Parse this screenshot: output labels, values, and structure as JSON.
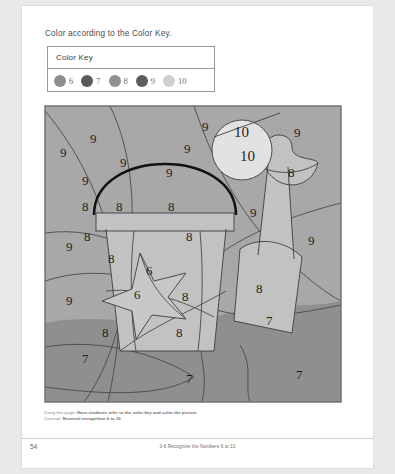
{
  "worksheet": {
    "instruction": "Color according to the Color Key.",
    "color_key": {
      "title": "Color Key",
      "entries": [
        {
          "number": "6",
          "color": "#8e8e8e"
        },
        {
          "number": "7",
          "color": "#5a5a5a"
        },
        {
          "number": "8",
          "color": "#909090"
        },
        {
          "number": "9",
          "color": "#5e5e5e"
        },
        {
          "number": "10",
          "color": "#cfcfcf"
        }
      ]
    },
    "footnote": {
      "using_label": "Using this page:",
      "using_text": "Have students refer to the color key and color the picture.",
      "concept_label": "Concept:",
      "concept_text": "Numeral recognition 6 to 10"
    },
    "page_number": "54",
    "footer_title": "3-6 Recognize the Numbers 6 to 10"
  },
  "picture": {
    "title": "beach scene color by number",
    "fills": {
      "sky": "#a8a8a8",
      "sand": "#8f8f8f",
      "bucket": "#c2c2c2",
      "star": "#c8c8c8",
      "shovel": "#c2c2c2",
      "sun": "#e2e2e2",
      "border": "#6d6d6d"
    },
    "labels": [
      {
        "value": "9",
        "x": 46,
        "y": 38
      },
      {
        "value": "9",
        "x": 16,
        "y": 52
      },
      {
        "value": "9",
        "x": 158,
        "y": 26
      },
      {
        "value": "9",
        "x": 250,
        "y": 32
      },
      {
        "value": "9",
        "x": 140,
        "y": 48
      },
      {
        "value": "9",
        "x": 76,
        "y": 62
      },
      {
        "value": "9",
        "x": 122,
        "y": 72
      },
      {
        "value": "9",
        "x": 38,
        "y": 80
      },
      {
        "value": "9",
        "x": 206,
        "y": 112
      },
      {
        "value": "9",
        "x": 264,
        "y": 140
      },
      {
        "value": "9",
        "x": 22,
        "y": 146
      },
      {
        "value": "9",
        "x": 22,
        "y": 200
      },
      {
        "value": "10",
        "x": 190,
        "y": 32,
        "big": true
      },
      {
        "value": "10",
        "x": 196,
        "y": 56,
        "big": true
      },
      {
        "value": "8",
        "x": 244,
        "y": 72
      },
      {
        "value": "8",
        "x": 38,
        "y": 106
      },
      {
        "value": "8",
        "x": 72,
        "y": 106
      },
      {
        "value": "8",
        "x": 124,
        "y": 106
      },
      {
        "value": "8",
        "x": 40,
        "y": 136
      },
      {
        "value": "8",
        "x": 142,
        "y": 136
      },
      {
        "value": "8",
        "x": 64,
        "y": 158
      },
      {
        "value": "8",
        "x": 138,
        "y": 196
      },
      {
        "value": "8",
        "x": 58,
        "y": 232
      },
      {
        "value": "8",
        "x": 132,
        "y": 232
      },
      {
        "value": "8",
        "x": 212,
        "y": 188
      },
      {
        "value": "6",
        "x": 102,
        "y": 170
      },
      {
        "value": "6",
        "x": 90,
        "y": 194
      },
      {
        "value": "7",
        "x": 222,
        "y": 220
      },
      {
        "value": "7",
        "x": 38,
        "y": 258
      },
      {
        "value": "7",
        "x": 142,
        "y": 278
      },
      {
        "value": "7",
        "x": 252,
        "y": 274
      }
    ]
  }
}
